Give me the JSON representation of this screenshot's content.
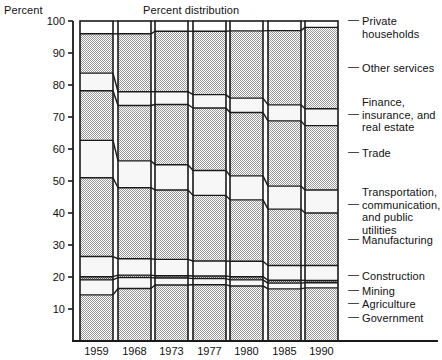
{
  "axis_label": "Percent",
  "title": "Percent distribution",
  "chart_data": {
    "type": "bar",
    "subtype": "stacked-100-percent",
    "title": "Percent distribution",
    "xlabel": "",
    "ylabel": "Percent",
    "ylim": [
      0,
      100
    ],
    "yticks": [
      10,
      20,
      30,
      40,
      50,
      60,
      70,
      80,
      90,
      100
    ],
    "grid": false,
    "legend_position": "right",
    "categories": [
      "1959",
      "1968",
      "1973",
      "1977",
      "1980",
      "1985",
      "1990"
    ],
    "series": [
      {
        "name": "Government",
        "values": [
          14.4,
          16.4,
          17.5,
          17.6,
          17.2,
          16.3,
          16.6
        ]
      },
      {
        "name": "Agriculture",
        "values": [
          4.7,
          3.4,
          2.2,
          1.9,
          1.9,
          1.8,
          1.6
        ]
      },
      {
        "name": "Mining",
        "values": [
          1.0,
          0.8,
          0.7,
          0.8,
          1.0,
          0.9,
          0.7
        ]
      },
      {
        "name": "Construction",
        "values": [
          6.3,
          5.1,
          5.1,
          4.7,
          4.8,
          4.6,
          4.7
        ]
      },
      {
        "name": "Manufacturing",
        "values": [
          24.6,
          22.2,
          21.7,
          20.5,
          19.2,
          17.6,
          16.4
        ]
      },
      {
        "name": "Transportation, communication, and public utilities",
        "values": [
          11.7,
          8.4,
          7.9,
          7.8,
          7.5,
          7.2,
          7.2
        ]
      },
      {
        "name": "Trade",
        "values": [
          15.5,
          17.3,
          18.8,
          19.5,
          19.8,
          20.4,
          20.1
        ]
      },
      {
        "name": "Finance, insurance, and real estate",
        "values": [
          5.5,
          4.3,
          4.0,
          4.2,
          4.5,
          5.0,
          5.3
        ]
      },
      {
        "name": "Other services",
        "values": [
          12.3,
          18.1,
          18.9,
          19.8,
          21.0,
          23.2,
          25.4
        ]
      },
      {
        "name": "Private households",
        "values": [
          4.0,
          4.0,
          3.2,
          3.2,
          3.1,
          3.0,
          2.0
        ]
      }
    ],
    "legend_entries": [
      "Private\nhouseholds",
      "Other services",
      "Finance,\ninsurance, and\nreal estate",
      "Trade",
      "Transportation,\ncommunication,\nand public utilities",
      "Manufacturing",
      "Construction",
      "Mining",
      "Agriculture",
      "Government"
    ],
    "colors": {
      "fill_shaded": "#d8d8d8",
      "fill_light": "#f2f2f2",
      "stroke": "#1a1a1a",
      "background": "#ffffff"
    }
  },
  "yticks": [
    "100",
    "90",
    "80",
    "70",
    "60",
    "50",
    "40",
    "30",
    "20",
    "10"
  ],
  "xticks": [
    "1959",
    "1968",
    "1973",
    "1977",
    "1980",
    "1985",
    "1990"
  ],
  "legend": {
    "items": [
      {
        "label": "Private\nhouseholds",
        "dash": "—"
      },
      {
        "label": "Other services",
        "dash": "—"
      },
      {
        "label": "Finance,\ninsurance, and\nreal estate",
        "dash": "—"
      },
      {
        "label": "Trade",
        "dash": "—"
      },
      {
        "label": "Transportation,\ncommunication,\nand public utilities",
        "dash": "—"
      },
      {
        "label": "Manufacturing",
        "dash": "—"
      },
      {
        "label": "Construction",
        "dash": "—"
      },
      {
        "label": "Mining",
        "dash": "—"
      },
      {
        "label": "Agriculture",
        "dash": "—"
      },
      {
        "label": "Government",
        "dash": "—"
      }
    ]
  }
}
